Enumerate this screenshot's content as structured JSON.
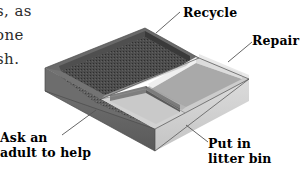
{
  "page": {
    "width": 305,
    "height": 171,
    "background": "#ffffff"
  },
  "body_text": {
    "note": "partial body copy clipped by the left edge of the scan",
    "lines": [
      "s, as",
      "one",
      "sh."
    ]
  },
  "figure": {
    "kind": "isometric-line-drawing",
    "compartments": [
      {
        "id": "recycle",
        "position": "back",
        "label_line_1": "Recycle",
        "label_line_2": "",
        "fill": "#4a4a4a",
        "texture": "stippled"
      },
      {
        "id": "repair",
        "position": "right",
        "label_line_1": "Repair",
        "label_line_2": "",
        "fill": "#b9b9b9",
        "texture": "smooth"
      },
      {
        "id": "ask-an-adult",
        "position": "left",
        "label_line_1": "Ask an",
        "label_line_2": "adult to help",
        "fill": "#5c5c5c",
        "texture": "stippled"
      },
      {
        "id": "litter-bin",
        "position": "front",
        "label_line_1": "Put in",
        "label_line_2": "litter bin",
        "fill": "#d8d8d8",
        "texture": "smooth"
      }
    ],
    "colors": {
      "ink": "#000000",
      "leader_line": "#555555",
      "rim_top_light": "#e6e6e6",
      "rim_top_mid": "#c6c6c6",
      "side_light": "#dcdcdc",
      "side_mid": "#9a9a9a",
      "side_dark": "#6f6f6f",
      "interior_dark": "#3f3f3f",
      "interior_mid": "#7d7d7d",
      "interior_light": "#cfcfcf"
    }
  }
}
